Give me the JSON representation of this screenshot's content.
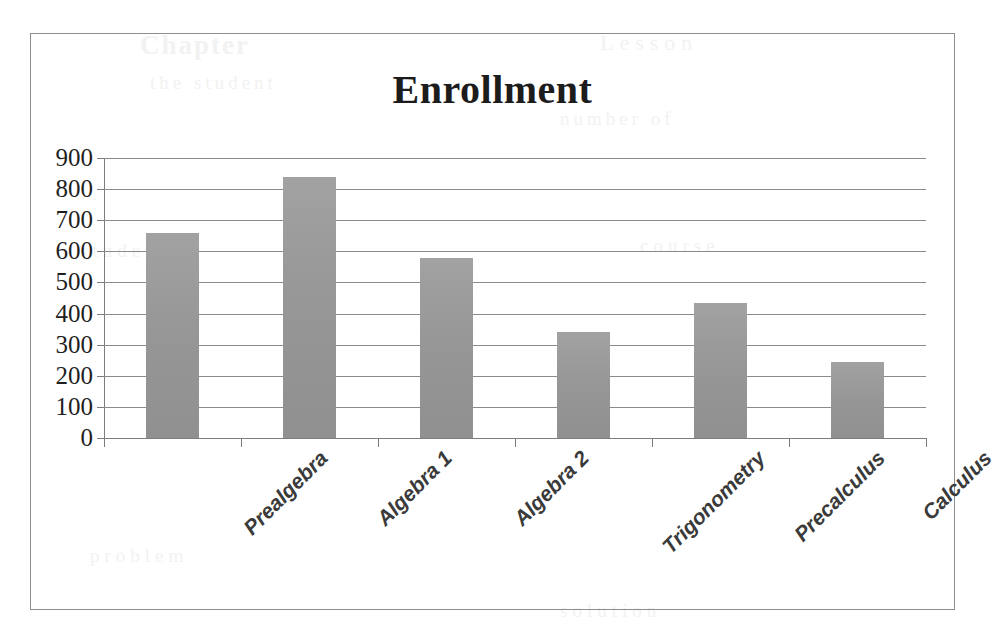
{
  "chart_data": {
    "type": "bar",
    "title": "Enrollment",
    "xlabel": "",
    "ylabel": "",
    "categories": [
      "Prealgebra",
      "Algebra 1",
      "Algebra 2",
      "Trigonometry",
      "Precalculus",
      "Calculus"
    ],
    "values": [
      660,
      840,
      580,
      340,
      435,
      245
    ],
    "ylim": [
      0,
      900
    ],
    "ytick_labels": [
      "900",
      "800",
      "700",
      "600",
      "500",
      "400",
      "300",
      "200",
      "100",
      "0"
    ],
    "ytick_values": [
      900,
      800,
      700,
      600,
      500,
      400,
      300,
      200,
      100,
      0
    ],
    "grid": true,
    "legend": false,
    "series_name": "Enrollment",
    "bar_color": "#9a9a9a",
    "gridline_color": "#8a8a8a",
    "axis_color": "#7d7d7d",
    "title_color": "#1c1c1c",
    "frame_color": "#8e8e8e"
  },
  "background_bleed": {
    "line_a": "Chapter",
    "line_b": "Lesson",
    "line_c": "the student",
    "line_d": "number of",
    "line_e": "students",
    "line_f": "course",
    "line_g": "problem",
    "line_h": "solution"
  }
}
